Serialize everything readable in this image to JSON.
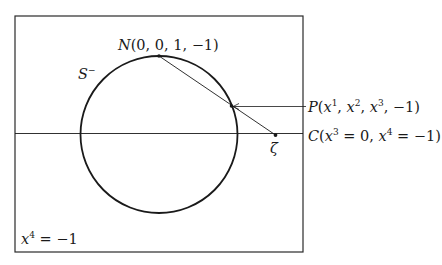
{
  "diagram": {
    "type": "stereographic-projection",
    "colors": {
      "stroke": "#1a1a1a",
      "frame": "#2a2a2a",
      "background": "#ffffff"
    },
    "frame": {
      "x": 15,
      "y": 16,
      "width": 288,
      "height": 236
    },
    "sphere": {
      "cx": 159,
      "cy": 134.5,
      "r": 78.5,
      "label": "S",
      "label_sup": "−"
    },
    "plane_line": {
      "y": 133.5,
      "label_prefix": "C(x",
      "label_sup1": "3",
      "label_mid": " = 0, x",
      "label_sup2": "4",
      "label_suffix": " = −1)"
    },
    "points": {
      "N": {
        "x": 159,
        "y": 56,
        "label": "N(0, 0, 1, −1)"
      },
      "P": {
        "x": 231.5,
        "y": 106,
        "label_prefix": "P(x",
        "sup1": "1",
        "mid1": ", x",
        "sup2": "2",
        "mid2": ", x",
        "sup3": "3",
        "label_suffix": ", −1)"
      },
      "zeta": {
        "x": 275.5,
        "y": 135,
        "label": "ζ"
      }
    },
    "plane_label": {
      "prefix": "x",
      "sup": "4",
      "suffix": " = −1"
    }
  }
}
